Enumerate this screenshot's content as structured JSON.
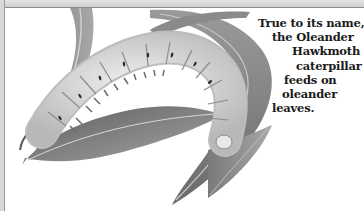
{
  "figure": {
    "caption_lines": [
      "True to its name,",
      "the Oleander",
      "Hawkmoth",
      "caterpillar",
      "feeds on",
      "oleander",
      "leaves."
    ]
  },
  "colors": {
    "leaf_dark": "#6e6e6e",
    "leaf_mid": "#9a9a9a",
    "body_light": "#dedede",
    "text": "#1a1a1a"
  }
}
